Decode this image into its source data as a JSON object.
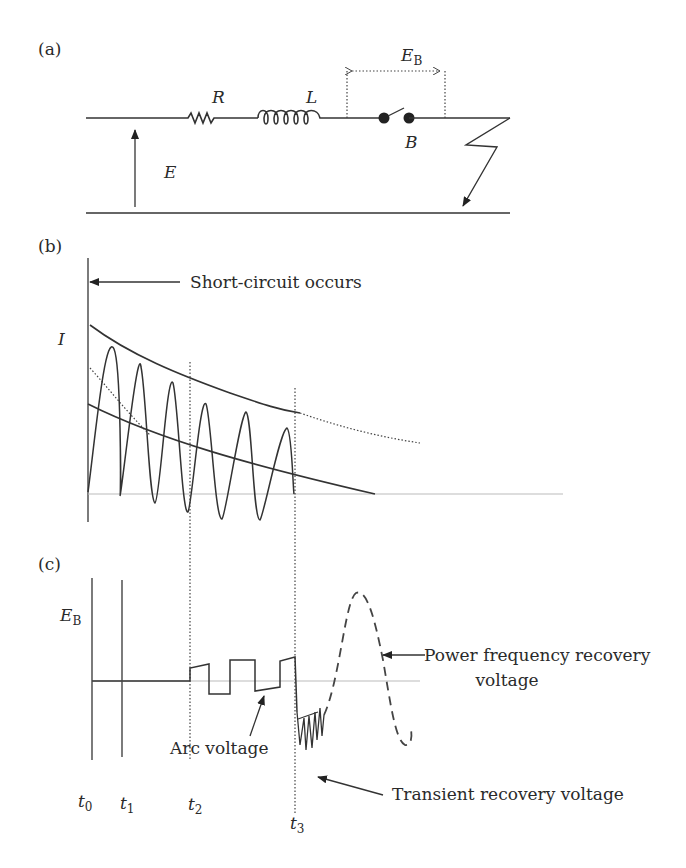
{
  "panels": {
    "a": {
      "label": "(a)",
      "components": {
        "resistor": "R",
        "inductor": "L",
        "breaker": "B",
        "source_voltage": "E",
        "breaker_voltage": "E",
        "breaker_voltage_sub": "B"
      }
    },
    "b": {
      "label": "(b)",
      "y_axis_label": "I",
      "annotation": "Short-circuit occurs"
    },
    "c": {
      "label": "(c)",
      "y_axis_label": "E",
      "y_axis_label_sub": "B",
      "annotations": {
        "arc": "Arc voltage",
        "power_line1": "Power frequency recovery",
        "power_line2": "voltage",
        "transient": "Transient recovery voltage"
      },
      "time_marks": [
        {
          "t": "t",
          "sub": "0"
        },
        {
          "t": "t",
          "sub": "1"
        },
        {
          "t": "t",
          "sub": "2"
        },
        {
          "t": "t",
          "sub": "3"
        }
      ]
    }
  },
  "colors": {
    "ink": "#333333",
    "grid": "#bbbbbb",
    "background": "#ffffff"
  }
}
